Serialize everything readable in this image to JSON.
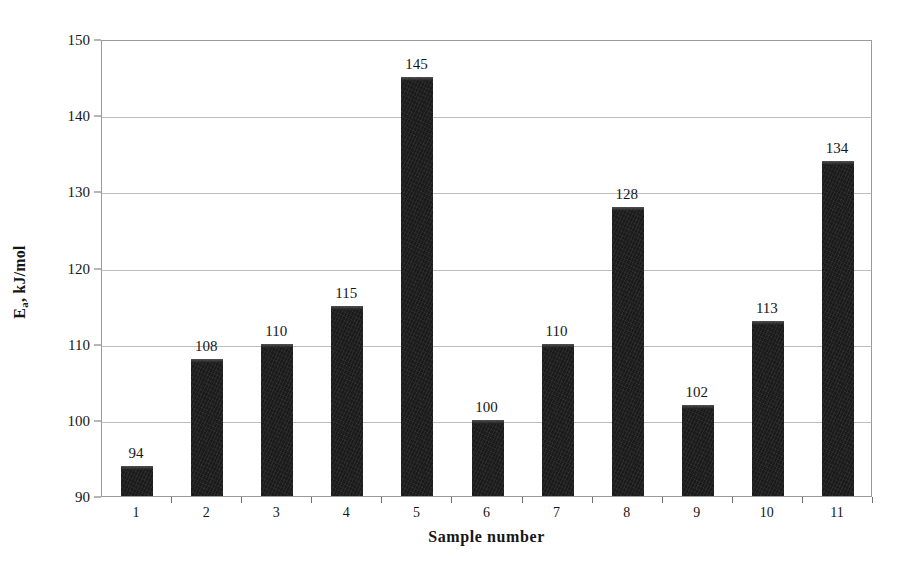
{
  "chart_data": {
    "type": "bar",
    "title": "",
    "subtitle": "",
    "xlabel": "Sample number",
    "ylabel": "Ea, kJ/mol",
    "ylabel_base": "E",
    "ylabel_sub": "a",
    "ylabel_rest": ", kJ/mol",
    "categories": [
      "1",
      "2",
      "3",
      "4",
      "5",
      "6",
      "7",
      "8",
      "9",
      "10",
      "11"
    ],
    "values": [
      94,
      108,
      110,
      115,
      145,
      100,
      110,
      128,
      102,
      113,
      134
    ],
    "value_labels": [
      "94",
      "108",
      "110",
      "115",
      "145",
      "100",
      "110",
      "128",
      "102",
      "113",
      "134"
    ],
    "ylim": [
      90,
      150
    ],
    "ytick_values": [
      90,
      100,
      110,
      120,
      130,
      140,
      150
    ],
    "ytick_labels": [
      "90",
      "100",
      "110",
      "120",
      "130",
      "140",
      "150"
    ],
    "grid": true,
    "grid_axis": "y",
    "legend": false,
    "legend_position": "none",
    "bar_color": "#1b1b1b",
    "grid_color": "#bdbdbd",
    "axis_color": "#9b9b9b",
    "background_color": "#ffffff",
    "text_color": "#161616"
  }
}
